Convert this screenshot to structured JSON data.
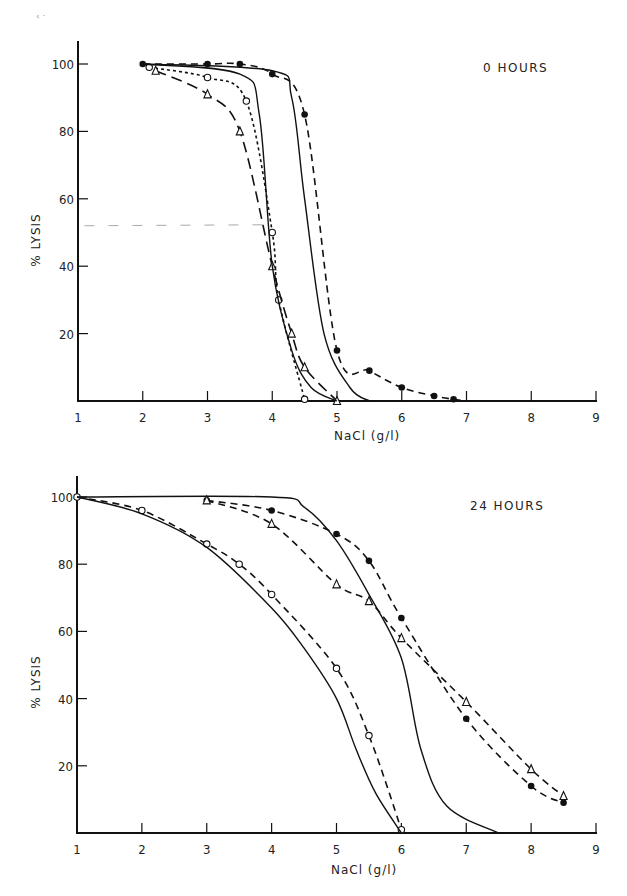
{
  "figure": {
    "stray_mark": "‹ ·"
  },
  "chart_data": [
    {
      "type": "line",
      "title": "0 HOURS",
      "xlabel": "NaCl (g/l)",
      "ylabel": "% LYSIS",
      "xlim": [
        1,
        9
      ],
      "ylim": [
        0,
        105
      ],
      "x_ticks": [
        "1",
        "2",
        "3",
        "4",
        "5",
        "6",
        "7",
        "8",
        "9"
      ],
      "y_ticks": [
        "20",
        "40",
        "60",
        "80",
        "100"
      ],
      "grid": false,
      "legend": null,
      "reference_line": {
        "style": "light dashed",
        "y": 52,
        "x_range": [
          1.1,
          3.9
        ]
      },
      "series": [
        {
          "name": "filled circles (dashed)",
          "marker": "filled-circle",
          "line": "dashed",
          "points": [
            [
              2.0,
              100
            ],
            [
              3.0,
              100
            ],
            [
              3.5,
              100
            ],
            [
              4.0,
              97
            ],
            [
              4.5,
              85
            ],
            [
              5.0,
              15
            ],
            [
              5.5,
              9
            ],
            [
              6.0,
              4
            ],
            [
              6.5,
              1.5
            ],
            [
              6.8,
              0.5
            ],
            [
              7.0,
              0
            ]
          ]
        },
        {
          "name": "open circles (dotted)",
          "marker": "open-circle",
          "line": "dotted",
          "points": [
            [
              2.1,
              99
            ],
            [
              3.0,
              96
            ],
            [
              3.6,
              89
            ],
            [
              4.0,
              50
            ],
            [
              4.1,
              30
            ],
            [
              4.5,
              0.5
            ]
          ]
        },
        {
          "name": "open triangles (long dash)",
          "marker": "open-triangle",
          "line": "long-dashed",
          "points": [
            [
              2.2,
              98
            ],
            [
              3.0,
              91
            ],
            [
              3.5,
              80
            ],
            [
              4.0,
              40
            ],
            [
              4.3,
              20
            ],
            [
              4.5,
              10
            ],
            [
              5.0,
              0
            ]
          ]
        },
        {
          "name": "solid curve A",
          "marker": "none",
          "line": "solid",
          "points": [
            [
              2.0,
              100
            ],
            [
              3.5,
              97
            ],
            [
              3.8,
              85
            ],
            [
              4.0,
              40
            ],
            [
              4.3,
              15
            ],
            [
              4.6,
              4
            ],
            [
              5.0,
              0
            ]
          ]
        },
        {
          "name": "solid curve B",
          "marker": "none",
          "line": "solid",
          "points": [
            [
              2.0,
              100
            ],
            [
              4.0,
              98
            ],
            [
              4.3,
              90
            ],
            [
              4.5,
              60
            ],
            [
              4.8,
              20
            ],
            [
              5.2,
              4
            ],
            [
              5.5,
              0
            ]
          ]
        }
      ]
    },
    {
      "type": "line",
      "title": "24 HOURS",
      "xlabel": "NaCl (g/l)",
      "ylabel": "% LYSIS",
      "xlim": [
        1,
        9
      ],
      "ylim": [
        0,
        105
      ],
      "x_ticks": [
        "1",
        "2",
        "3",
        "4",
        "5",
        "6",
        "7",
        "8",
        "9"
      ],
      "y_ticks": [
        "20",
        "40",
        "60",
        "80",
        "100"
      ],
      "grid": false,
      "legend": null,
      "series": [
        {
          "name": "filled circles (dashed)",
          "marker": "filled-circle",
          "line": "dashed",
          "points": [
            [
              3.0,
              99
            ],
            [
              4.0,
              96
            ],
            [
              5.0,
              89
            ],
            [
              5.5,
              81
            ],
            [
              6.0,
              64
            ],
            [
              7.0,
              34
            ],
            [
              8.0,
              14
            ],
            [
              8.5,
              9
            ]
          ]
        },
        {
          "name": "open triangles (dashed)",
          "marker": "open-triangle",
          "line": "dashed",
          "points": [
            [
              3.0,
              99
            ],
            [
              4.0,
              92
            ],
            [
              5.0,
              74
            ],
            [
              5.5,
              69
            ],
            [
              6.0,
              58
            ],
            [
              7.0,
              39
            ],
            [
              8.0,
              19
            ],
            [
              8.5,
              11
            ]
          ]
        },
        {
          "name": "open circles (dashed)",
          "marker": "open-circle",
          "line": "dashed",
          "points": [
            [
              1.0,
              100
            ],
            [
              2.0,
              96
            ],
            [
              3.0,
              86
            ],
            [
              3.5,
              80
            ],
            [
              4.0,
              71
            ],
            [
              5.0,
              49
            ],
            [
              5.5,
              29
            ],
            [
              6.0,
              1
            ]
          ]
        },
        {
          "name": "solid curve A",
          "marker": "none",
          "line": "solid",
          "points": [
            [
              1.0,
              100
            ],
            [
              2.0,
              95
            ],
            [
              3.0,
              85
            ],
            [
              4.0,
              67
            ],
            [
              4.5,
              55
            ],
            [
              5.0,
              40
            ],
            [
              5.3,
              25
            ],
            [
              5.6,
              12
            ],
            [
              6.0,
              0
            ]
          ]
        },
        {
          "name": "solid curve B",
          "marker": "none",
          "line": "solid",
          "points": [
            [
              1.0,
              100
            ],
            [
              4.0,
              100
            ],
            [
              4.5,
              97
            ],
            [
              5.0,
              87
            ],
            [
              5.5,
              71
            ],
            [
              6.0,
              52
            ],
            [
              6.3,
              25
            ],
            [
              6.7,
              8
            ],
            [
              7.5,
              0
            ]
          ]
        }
      ]
    }
  ]
}
